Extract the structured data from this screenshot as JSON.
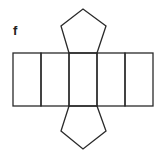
{
  "figure": {
    "label": "f",
    "stroke_color": "#2a2a2a",
    "rectangles": [
      {
        "x": 13,
        "y": 53,
        "w": 28,
        "h": 53
      },
      {
        "x": 41,
        "y": 53,
        "w": 28,
        "h": 53
      },
      {
        "x": 69,
        "y": 53,
        "w": 28,
        "h": 53
      },
      {
        "x": 97,
        "y": 53,
        "w": 28,
        "h": 53
      },
      {
        "x": 125,
        "y": 53,
        "w": 28,
        "h": 53
      }
    ],
    "pentagons": [
      {
        "position": "top",
        "points": "69,53 61,26 83,9 106,26 97,53"
      },
      {
        "position": "bottom",
        "points": "69,106 61,131 83,149 106,131 97,106"
      }
    ]
  }
}
